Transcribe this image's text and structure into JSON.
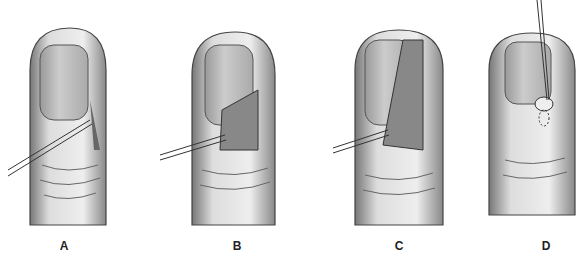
{
  "figure": {
    "panels": [
      {
        "label": "A",
        "x": 24,
        "label_x": 64,
        "description": "fingertip with incision lateral to nail, held with forceps"
      },
      {
        "label": "B",
        "x": 184,
        "label_x": 237,
        "description": "lateral nail fold flap retracted exposing granular tissue"
      },
      {
        "label": "C",
        "x": 336,
        "label_x": 399,
        "description": "excision extended along nail border"
      },
      {
        "label": "D",
        "x": 487,
        "label_x": 545,
        "description": "probe lifting nodule at nail fold with dashed outline"
      }
    ]
  }
}
